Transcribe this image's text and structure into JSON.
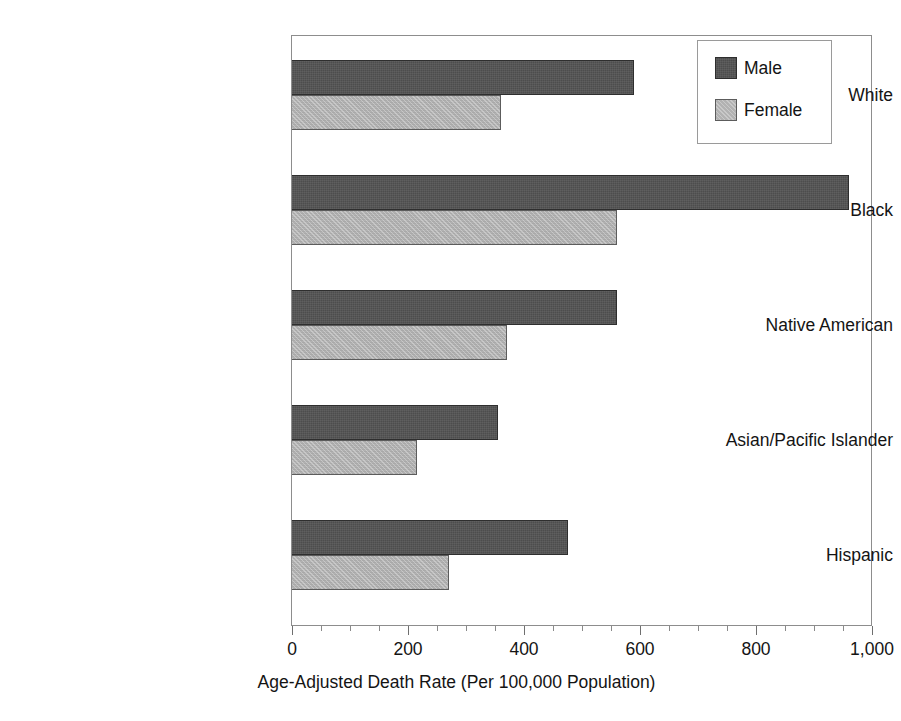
{
  "chart_data": {
    "type": "bar",
    "orientation": "horizontal",
    "title": "",
    "subtitle": "",
    "xlabel": "Age-Adjusted Death Rate (Per 100,000 Population)",
    "ylabel": "",
    "categories": [
      "White",
      "Black",
      "Native American",
      "Asian/Pacific Islander",
      "Hispanic"
    ],
    "series": [
      {
        "name": "Male",
        "color": "#4d4d4d",
        "values": [
          590,
          960,
          560,
          355,
          475
        ]
      },
      {
        "name": "Female",
        "color": "#b2b2b2",
        "values": [
          360,
          560,
          370,
          215,
          270
        ]
      }
    ],
    "xlim": [
      0,
      1000
    ],
    "xticks": [
      0,
      200,
      400,
      600,
      800,
      1000
    ],
    "xtick_labels": [
      "0",
      "200",
      "400",
      "600",
      "800",
      "1,000"
    ],
    "minor_tick_interval": 50,
    "grid": false,
    "legend": {
      "position": "top-right",
      "entries": [
        "Male",
        "Female"
      ]
    },
    "frame": true
  },
  "legend": {
    "items": [
      {
        "label": "Male",
        "swatch": "male-swatch"
      },
      {
        "label": "Female",
        "swatch": "female-swatch"
      }
    ]
  },
  "axis": {
    "x_title": "Age-Adjusted Death Rate (Per 100,000 Population)",
    "tick_labels": [
      "0",
      "200",
      "400",
      "600",
      "800",
      "1,000"
    ]
  },
  "categories": [
    {
      "label": "White"
    },
    {
      "label": "Black"
    },
    {
      "label": "Native American"
    },
    {
      "label": "Asian/Pacific Islander"
    },
    {
      "label": "Hispanic"
    }
  ]
}
